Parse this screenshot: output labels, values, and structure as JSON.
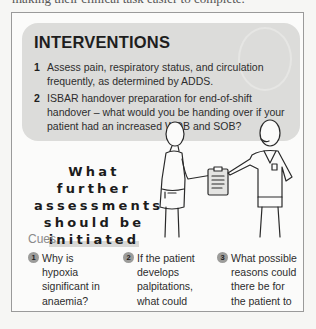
{
  "top_cutoff_text": "making their clinical task easier to complete.",
  "box": {
    "heading": "INTERVENTIONS",
    "interventions": [
      {
        "num": "1",
        "text": "Assess pain, respiratory status, and circulation frequently, as determined by ADDS."
      },
      {
        "num": "2",
        "text": "ISBAR handover preparation for end-of-shift handover – what would you be handing over if your patient had an increased WOB and SOB?"
      }
    ],
    "question_lines": [
      "What further",
      "assessments",
      "should be",
      "initiated"
    ],
    "illustration": "two-nurses-handover-clipboard",
    "cues_label": "Cues",
    "cues": [
      {
        "num": "1",
        "text": "Why is hypoxia significant in anaemia?"
      },
      {
        "num": "2",
        "text": "If the patient develops palpitations, what could this be evidence of?"
      },
      {
        "num": "3",
        "text": "What possible reasons could there be for the patient to report increased SOB?"
      }
    ]
  },
  "colors": {
    "panel": "#dcdcda",
    "badge": "#9c9c9a",
    "cues_label": "#8a8a8a",
    "frame_border": "#9a9a9a"
  }
}
